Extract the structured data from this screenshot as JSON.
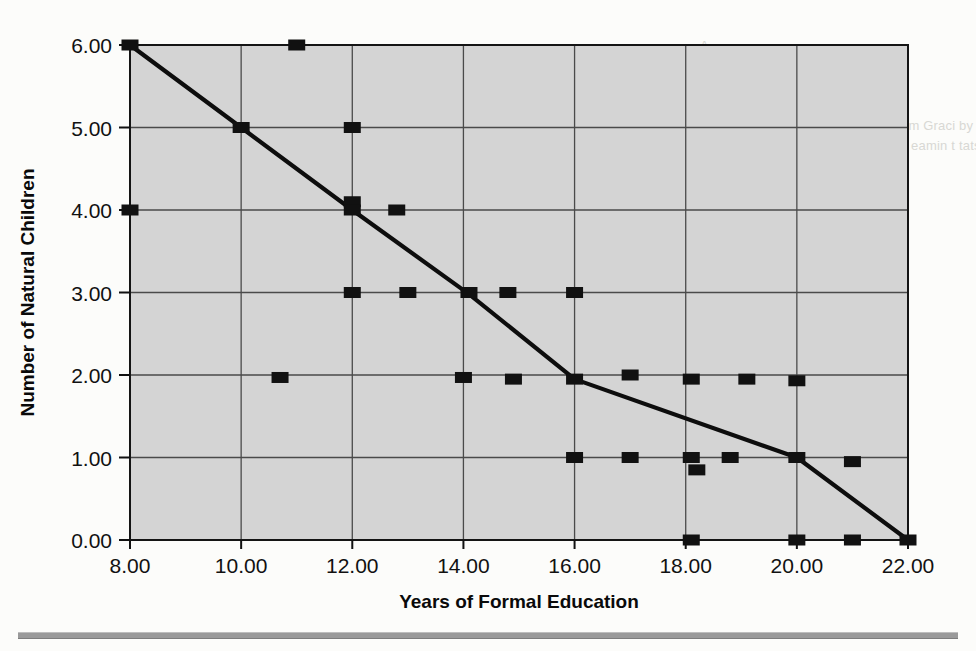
{
  "figure": {
    "background_color": "#d4d4d4",
    "plot_border_color": "#141414",
    "grid_color": "#4a4a4a",
    "marker_color": "#111111",
    "line_color": "#0d0d0d"
  },
  "axes": {
    "x_title": "Years of Formal Education",
    "y_title": "Number of Natural Children",
    "x_ticks": [
      "8.00",
      "10.00",
      "12.00",
      "14.00",
      "16.00",
      "18.00",
      "20.00",
      "22.00"
    ],
    "y_ticks": [
      "0.00",
      "1.00",
      "2.00",
      "3.00",
      "4.00",
      "5.00",
      "6.00"
    ]
  },
  "ghost_text": {
    "top_right": "A\nveu isi oil tho ben nd tsrse\nraph b.s tued th in of co dl\nb to\nner Neither as CEO hall the mentium Graci by nine an in the\nonlow voter rom. P'CBBO or K. T n eamin t tats 4 y fear\nmetdsa tion",
    "mid_right": "ton                        io\nres\nre\nooi\nco\nion\nto"
  },
  "chart_data": {
    "type": "scatter",
    "title": "",
    "xlabel": "Years of Formal Education",
    "ylabel": "Number of Natural Children",
    "xlim": [
      8,
      22
    ],
    "ylim": [
      0,
      6
    ],
    "xticks": [
      8,
      10,
      12,
      14,
      16,
      18,
      20,
      22
    ],
    "yticks": [
      0,
      1,
      2,
      3,
      4,
      5,
      6
    ],
    "grid": true,
    "legend": "none",
    "marker": "filled-square",
    "series": [
      {
        "name": "Observed cases",
        "type": "scatter",
        "points": [
          [
            8.0,
            6.0
          ],
          [
            8.0,
            4.0
          ],
          [
            10.0,
            5.0
          ],
          [
            10.7,
            1.97
          ],
          [
            11.0,
            6.0
          ],
          [
            12.0,
            5.0
          ],
          [
            12.0,
            4.1
          ],
          [
            12.0,
            4.0
          ],
          [
            12.0,
            3.0
          ],
          [
            12.8,
            4.0
          ],
          [
            13.0,
            3.0
          ],
          [
            14.1,
            3.0
          ],
          [
            14.0,
            1.97
          ],
          [
            14.8,
            3.0
          ],
          [
            14.9,
            1.95
          ],
          [
            16.0,
            3.0
          ],
          [
            16.0,
            1.95
          ],
          [
            16.0,
            1.0
          ],
          [
            17.0,
            2.0
          ],
          [
            17.0,
            1.0
          ],
          [
            18.1,
            1.95
          ],
          [
            18.1,
            1.0
          ],
          [
            18.2,
            0.85
          ],
          [
            18.1,
            0.0
          ],
          [
            18.8,
            1.0
          ],
          [
            19.1,
            1.95
          ],
          [
            20.0,
            1.93
          ],
          [
            20.0,
            1.0
          ],
          [
            20.0,
            0.0
          ],
          [
            21.0,
            0.95
          ],
          [
            21.0,
            0.0
          ],
          [
            22.0,
            0.0
          ]
        ]
      },
      {
        "name": "Fitted trend line",
        "type": "line",
        "points": [
          [
            8.0,
            6.0
          ],
          [
            10.0,
            5.0
          ],
          [
            12.0,
            4.0
          ],
          [
            14.1,
            2.98
          ],
          [
            16.0,
            1.95
          ],
          [
            20.0,
            1.0
          ],
          [
            22.0,
            0.0
          ]
        ]
      }
    ]
  }
}
